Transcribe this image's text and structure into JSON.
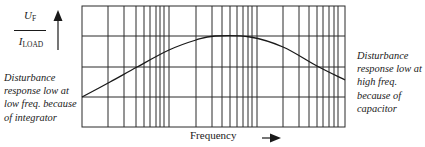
{
  "diagram": {
    "y_axis_label": {
      "numerator": "U",
      "numerator_sub": "F",
      "denominator": "I",
      "denominator_sub": "LOAD"
    },
    "x_axis_label": "Frequency",
    "annotations": {
      "left": "Disturbance response low at low freq. because of integrator",
      "right": "Disturbance response low at high freq. because of capacitor"
    },
    "grid": {
      "plot_box": {
        "left": 82,
        "top": 6,
        "right": 345,
        "bottom": 127
      },
      "horizontal_lines_y": [
        36,
        67,
        97
      ],
      "vertical_lines_x": [
        108,
        124,
        136,
        144,
        150,
        156,
        160,
        164,
        169,
        196,
        212,
        222,
        230,
        237,
        243,
        248,
        252,
        257,
        283,
        299,
        309,
        317,
        323,
        329,
        334,
        338
      ]
    },
    "curve_points": [
      [
        82,
        97
      ],
      [
        110,
        82
      ],
      [
        137,
        67
      ],
      [
        169,
        50
      ],
      [
        196,
        40
      ],
      [
        215,
        36
      ],
      [
        250,
        37
      ],
      [
        283,
        47
      ],
      [
        317,
        66
      ],
      [
        345,
        80
      ]
    ],
    "colors": {
      "line": "#1a1a1a",
      "background": "#ffffff"
    }
  }
}
